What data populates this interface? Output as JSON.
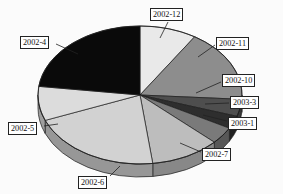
{
  "chart_data": {
    "type": "pie",
    "title": "",
    "three_d": true,
    "legend": "callout-labels",
    "labels": [
      "2002-12",
      "2002-11",
      "2002-10",
      "2003-3",
      "2003-1",
      "2002-7",
      "2002-6",
      "2002-5",
      "2002-4"
    ],
    "categories": [
      "2002-12",
      "2002-11",
      "2002-10",
      "2003-3",
      "2003-1",
      "2002-7",
      "2002-6",
      "2002-5",
      "2002-4"
    ],
    "values": [
      9,
      17,
      4,
      3,
      4,
      11,
      21,
      8,
      23
    ],
    "units": "percent",
    "slices": [
      {
        "label": "2002-12",
        "value": 9,
        "color": "#e9e9e9",
        "start_deg": -90,
        "end_deg": -57.6
      },
      {
        "label": "2002-11",
        "value": 17,
        "color": "#8d8d8d",
        "start_deg": -57.6,
        "end_deg": 3.6
      },
      {
        "label": "2002-10",
        "value": 4,
        "color": "#4e4e4e",
        "start_deg": 3.6,
        "end_deg": 18.0
      },
      {
        "label": "2003-3",
        "value": 3,
        "color": "#2e2e2e",
        "start_deg": 18.0,
        "end_deg": 28.8
      },
      {
        "label": "2003-1",
        "value": 4,
        "color": "#7a7a7a",
        "start_deg": 28.8,
        "end_deg": 43.2
      },
      {
        "label": "2002-7",
        "value": 11,
        "color": "#bdbdbd",
        "start_deg": 43.2,
        "end_deg": 82.8
      },
      {
        "label": "2002-6",
        "value": 21,
        "color": "#d2d2d2",
        "start_deg": 82.8,
        "end_deg": 158.4
      },
      {
        "label": "2002-5",
        "value": 8,
        "color": "#dcdcdc",
        "start_deg": 158.4,
        "end_deg": 187.2
      },
      {
        "label": "2002-4",
        "value": 23,
        "color": "#0a0a0a",
        "start_deg": 187.2,
        "end_deg": 270.0
      }
    ],
    "colors": [
      "#e9e9e9",
      "#8d8d8d",
      "#4e4e4e",
      "#2e2e2e",
      "#7a7a7a",
      "#bdbdbd",
      "#d2d2d2",
      "#dcdcdc",
      "#0a0a0a"
    ],
    "xlabel": "",
    "ylabel": "",
    "grid": false
  },
  "callouts": [
    {
      "name": "label-2002-12",
      "text": "2002-12",
      "x": 150,
      "y": 8,
      "leader": [
        168,
        22,
        160,
        38
      ]
    },
    {
      "name": "label-2002-11",
      "text": "2002-11",
      "x": 216,
      "y": 37,
      "leader": [
        215,
        45,
        198,
        57
      ]
    },
    {
      "name": "label-2002-10",
      "text": "2002-10",
      "x": 222,
      "y": 74,
      "leader": [
        221,
        82,
        196,
        93
      ]
    },
    {
      "name": "label-2003-3",
      "text": "2003-3",
      "x": 230,
      "y": 96,
      "leader": [
        229,
        103,
        205,
        104
      ]
    },
    {
      "name": "label-2003-1",
      "text": "2003-1",
      "x": 228,
      "y": 117,
      "leader": [
        227,
        121,
        203,
        115
      ]
    },
    {
      "name": "label-2002-7",
      "text": "2002-7",
      "x": 202,
      "y": 148,
      "leader": [
        201,
        152,
        180,
        143
      ]
    },
    {
      "name": "label-2002-6",
      "text": "2002-6",
      "x": 78,
      "y": 176,
      "leader": [
        110,
        176,
        120,
        166
      ]
    },
    {
      "name": "label-2002-5",
      "text": "2002-5",
      "x": 8,
      "y": 122,
      "leader": [
        44,
        126,
        58,
        124
      ]
    },
    {
      "name": "label-2002-4",
      "text": "2002-4",
      "x": 20,
      "y": 36,
      "leader": [
        56,
        44,
        78,
        54
      ]
    }
  ],
  "geometry": {
    "cx": 140,
    "cy": 95,
    "rx": 102,
    "ry": 69,
    "depth": 13
  }
}
